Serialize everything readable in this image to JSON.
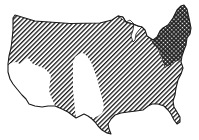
{
  "map": {
    "title": "Contiguous United States regional shading map",
    "subject": "contiguous-united-states",
    "style": "black-and-white line drawing with hatch patterns",
    "colors": {
      "background": "#ffffff",
      "ink": "#1a1a1a"
    },
    "regions": [
      {
        "name": "Northeast",
        "pattern": "crosshatch",
        "description": "New England, New York, Pennsylvania region shaded with crosshatch/checker pattern"
      },
      {
        "name": "Most of country",
        "pattern": "diagonal-hatch",
        "description": "Northwest, northern plains, Midwest, South and Southeast shaded with diagonal lines"
      },
      {
        "name": "Southwest",
        "pattern": "none",
        "description": "California, Nevada, Arizona area left unshaded (white)"
      },
      {
        "name": "Central Plains",
        "pattern": "none",
        "description": "Texas and central plains strip left unshaded (white)"
      }
    ]
  }
}
